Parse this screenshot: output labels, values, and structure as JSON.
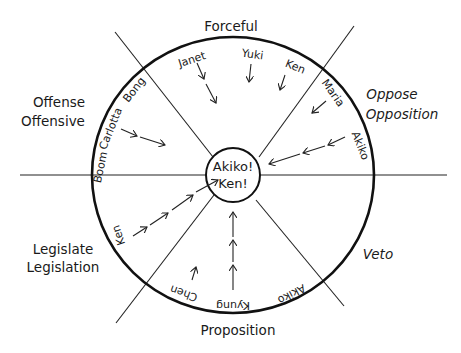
{
  "diagram": {
    "sectors": {
      "top": "Forceful",
      "upper_left": [
        "Offense",
        "Offensive"
      ],
      "upper_right": [
        "Oppose",
        "Opposition"
      ],
      "lower_left": [
        "Legislate",
        "Legislation"
      ],
      "lower_right": "Veto",
      "bottom": "Proposition"
    },
    "center": [
      "Akiko!",
      "Ken!"
    ],
    "names": {
      "janet": "Janet",
      "yuki": "Yuki",
      "ken_top": "Ken",
      "maria": "Maria",
      "akiko_right": "Akiko",
      "boom": "Boom",
      "carlotta": "Carlotta",
      "bong": "Bong",
      "ken_left": "Ken",
      "chen": "Chen",
      "kyung": "Kyung",
      "akiko_bottom": "Akiko"
    }
  }
}
